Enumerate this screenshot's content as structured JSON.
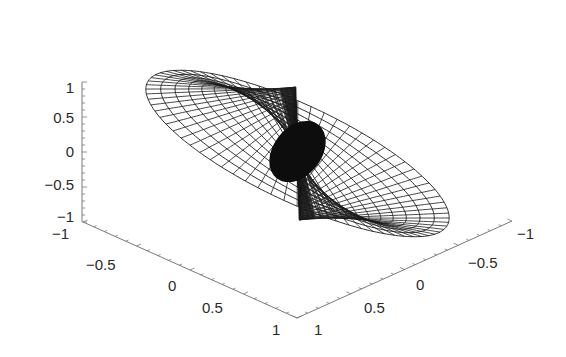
{
  "chart_data": {
    "type": "surface3d",
    "title": "",
    "xlabel": "",
    "ylabel": "",
    "zlabel": "",
    "mesh": {
      "radial_rings": 16,
      "angular_lines": 72,
      "r_max": 1.0
    },
    "xlim": [
      -1,
      1
    ],
    "ylim": [
      -1,
      1
    ],
    "zlim": [
      -1,
      1
    ],
    "grid": false,
    "x_axis": {
      "ticks": [
        -1,
        -0.5,
        0,
        0.5,
        1
      ],
      "tick_labels": [
        "-1",
        "-0.5",
        "0",
        "0.5",
        "1"
      ]
    },
    "y_axis": {
      "ticks": [
        1,
        0.5,
        0,
        -0.5,
        -1
      ],
      "tick_labels": [
        "1",
        "0.5",
        "0",
        "-0.5",
        "-1"
      ]
    },
    "z_axis": {
      "ticks": [
        1,
        0.5,
        0,
        -0.5,
        -1
      ],
      "tick_labels": [
        "1",
        "0.5",
        "0",
        "-0.5",
        "-1"
      ]
    }
  },
  "labels": {
    "z": [
      "1",
      "0.5",
      "0",
      "−0.5",
      "−1"
    ],
    "x": [
      "−1",
      "−0.5",
      "0",
      "0.5",
      "1"
    ],
    "y": [
      "1",
      "0.5",
      "0",
      "−0.5",
      "−1"
    ]
  },
  "colors": {
    "mesh": "#1a1a1a",
    "axis": "#7a7a7a",
    "background": "#ffffff"
  }
}
